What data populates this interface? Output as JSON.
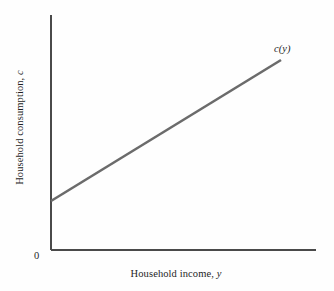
{
  "chart_data": {
    "type": "line",
    "title": "",
    "subtitle": "",
    "xlabel_text": "Household income,",
    "xlabel_symbol": "y",
    "ylabel_text": "Household consumption,",
    "ylabel_symbol": "c",
    "origin_label": "0",
    "grid": false,
    "legend_position": "none",
    "annotations": [
      {
        "name": "consumption-function-label",
        "text": "c(y)",
        "x": 286,
        "y": 50
      }
    ],
    "axes": {
      "x_axis": {
        "x1": 51,
        "y1": 250,
        "x2": 316,
        "y2": 250
      },
      "y_axis": {
        "x1": 51,
        "y1": 15,
        "x2": 51,
        "y2": 250
      },
      "xlim": [
        0,
        1
      ],
      "ylim": [
        0,
        1
      ],
      "x_ticks": [],
      "y_ticks": []
    },
    "series": [
      {
        "name": "c(y)",
        "color": "#6b6b6b",
        "intercept_pixel": {
          "x": 51,
          "y": 201
        },
        "endpoint_pixel": {
          "x": 281,
          "y": 60
        },
        "x": [
          0.0,
          1.0
        ],
        "values": [
          0.208,
          0.808
        ],
        "description": "Linear consumption function with positive intercept and slope less than one"
      }
    ]
  },
  "colors": {
    "background": "#fefefe",
    "axis": "#4a4a4a",
    "series": "#6b6b6b",
    "text": "#1f1f1f"
  }
}
